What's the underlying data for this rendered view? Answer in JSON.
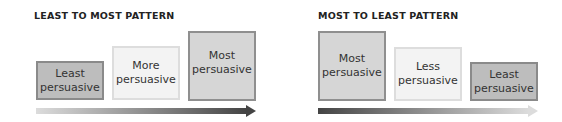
{
  "left_panel": {
    "title": "LEAST TO MOST PATTERN",
    "boxes": [
      {
        "line1": "Least",
        "line2": "persuasive"
      },
      {
        "line1": "More",
        "line2": "persuasive"
      },
      {
        "line1": "Most",
        "line2": "persuasive"
      }
    ],
    "arrow": {
      "direction": "right",
      "gradient_from": "#dcdcdc",
      "gradient_to": "#444444"
    }
  },
  "right_panel": {
    "title": "MOST TO LEAST PATTERN",
    "boxes": [
      {
        "line1": "Most",
        "line2": "persuasive"
      },
      {
        "line1": "Less",
        "line2": "persuasive"
      },
      {
        "line1": "Least",
        "line2": "persuasive"
      }
    ],
    "arrow": {
      "direction": "right",
      "gradient_from": "#444444",
      "gradient_to": "#dcdcdc"
    }
  },
  "colors": {
    "box_dark_fill": "#bdbdbd",
    "box_light_fill": "#f3f3f3",
    "box_mid_fill": "#d6d6d6"
  }
}
